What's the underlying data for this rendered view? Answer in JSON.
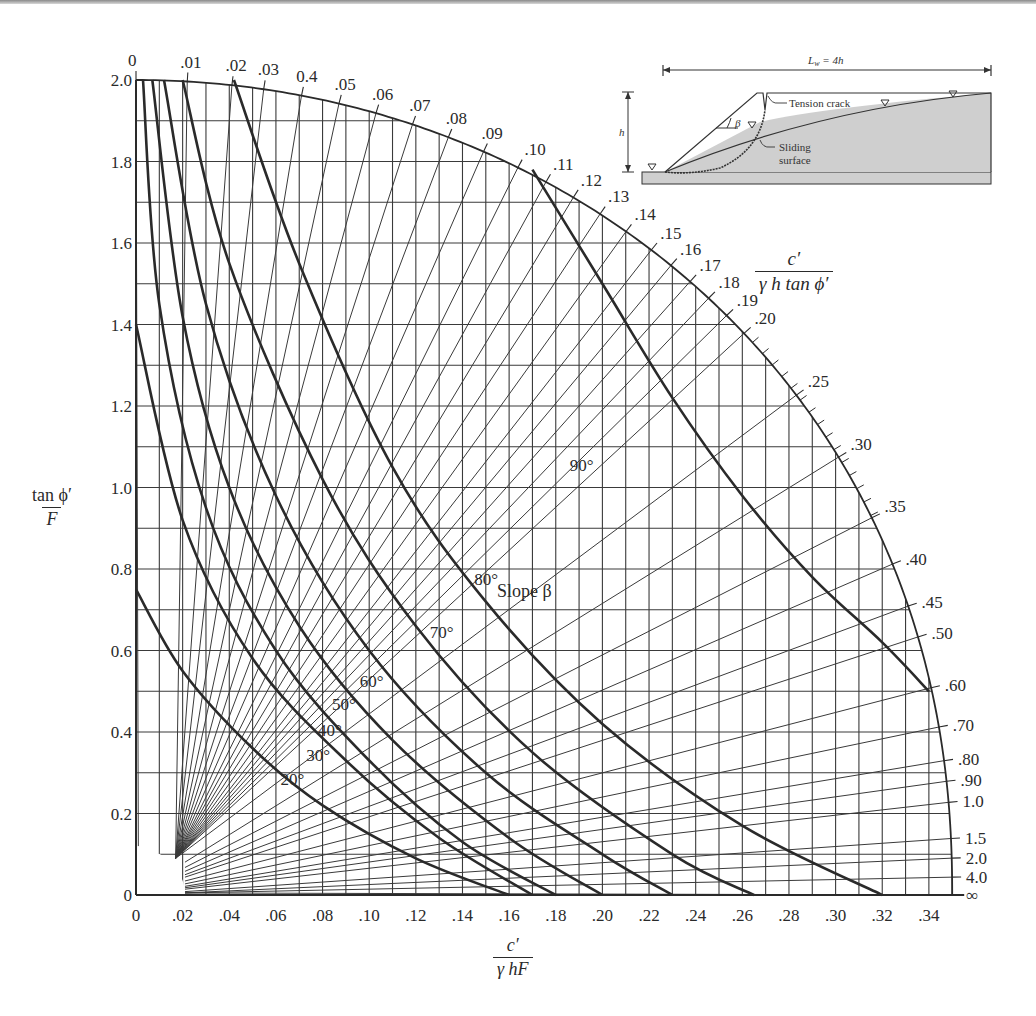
{
  "chart_data": {
    "type": "line",
    "title": "",
    "xlabel": {
      "numerator": "c′",
      "denominator": "γ hF"
    },
    "ylabel": {
      "numerator": "tan ϕ′",
      "denominator": "F"
    },
    "arc_label": {
      "numerator": "c′",
      "denominator": "γ h  tan ϕ′"
    },
    "xlim": [
      0,
      0.35
    ],
    "ylim": [
      0,
      2.0
    ],
    "grid": true,
    "x_ticks": [
      0,
      0.02,
      0.04,
      0.06,
      0.08,
      0.1,
      0.12,
      0.14,
      0.16,
      0.18,
      0.2,
      0.22,
      0.24,
      0.26,
      0.28,
      0.3,
      0.32,
      0.34
    ],
    "x_tick_labels": [
      "0",
      ".02",
      ".04",
      ".06",
      ".08",
      ".10",
      ".12",
      ".14",
      ".16",
      ".18",
      ".20",
      ".22",
      ".24",
      ".26",
      ".28",
      ".30",
      ".32",
      ".34"
    ],
    "y_ticks": [
      0,
      0.2,
      0.4,
      0.6,
      0.8,
      1.0,
      1.2,
      1.4,
      1.6,
      1.8,
      2.0
    ],
    "y_tick_labels": [
      "0",
      "0.2",
      "0.4",
      "0.6",
      "0.8",
      "1.0",
      "1.2",
      "1.4",
      "1.6",
      "1.8",
      "2.0"
    ],
    "radial_lines": {
      "description": "Lines of constant c'/(γ h tan ϕ') radiating from near origin to the outer arc",
      "labels": [
        "0",
        ".01",
        ".02",
        ".03",
        "0.4",
        ".05",
        ".06",
        ".07",
        ".08",
        ".09",
        ".10",
        ".11",
        ".12",
        ".13",
        ".14",
        ".15",
        ".16",
        ".17",
        ".18",
        ".19",
        ".20",
        ".25",
        ".30",
        ".35",
        ".40",
        ".45",
        ".50",
        ".60",
        ".70",
        ".80",
        ".90",
        "1.0",
        "1.5",
        "2.0",
        "4.0",
        "∞"
      ],
      "values": [
        0,
        0.01,
        0.02,
        0.03,
        0.04,
        0.05,
        0.06,
        0.07,
        0.08,
        0.09,
        0.1,
        0.11,
        0.12,
        0.13,
        0.14,
        0.15,
        0.16,
        0.17,
        0.18,
        0.19,
        0.2,
        0.25,
        0.3,
        0.35,
        0.4,
        0.45,
        0.5,
        0.6,
        0.7,
        0.8,
        0.9,
        1.0,
        1.5,
        2.0,
        4.0,
        "inf"
      ]
    },
    "series": [
      {
        "name": "20°",
        "points": [
          [
            0,
            0.75
          ],
          [
            0.02,
            0.55
          ],
          [
            0.05,
            0.36
          ],
          [
            0.08,
            0.22
          ],
          [
            0.12,
            0.09
          ],
          [
            0.16,
            0
          ]
        ]
      },
      {
        "name": "30°",
        "points": [
          [
            0,
            1.4
          ],
          [
            0.02,
            0.92
          ],
          [
            0.05,
            0.58
          ],
          [
            0.09,
            0.33
          ],
          [
            0.13,
            0.14
          ],
          [
            0.17,
            0
          ]
        ]
      },
      {
        "name": "40°",
        "points": [
          [
            0.003,
            2.0
          ],
          [
            0.01,
            1.45
          ],
          [
            0.03,
            0.95
          ],
          [
            0.06,
            0.6
          ],
          [
            0.1,
            0.33
          ],
          [
            0.14,
            0.13
          ],
          [
            0.18,
            0
          ]
        ]
      },
      {
        "name": "50°",
        "points": [
          [
            0.007,
            2.0
          ],
          [
            0.02,
            1.42
          ],
          [
            0.04,
            1.0
          ],
          [
            0.07,
            0.66
          ],
          [
            0.11,
            0.38
          ],
          [
            0.16,
            0.14
          ],
          [
            0.2,
            0
          ]
        ]
      },
      {
        "name": "60°",
        "points": [
          [
            0.012,
            2.0
          ],
          [
            0.03,
            1.45
          ],
          [
            0.06,
            0.98
          ],
          [
            0.1,
            0.6
          ],
          [
            0.15,
            0.3
          ],
          [
            0.2,
            0.1
          ],
          [
            0.23,
            0
          ]
        ]
      },
      {
        "name": "70°",
        "points": [
          [
            0.02,
            2.0
          ],
          [
            0.04,
            1.55
          ],
          [
            0.08,
            1.02
          ],
          [
            0.12,
            0.66
          ],
          [
            0.17,
            0.35
          ],
          [
            0.23,
            0.1
          ],
          [
            0.265,
            0
          ]
        ]
      },
      {
        "name": "80°",
        "points": [
          [
            0.042,
            2.0
          ],
          [
            0.07,
            1.55
          ],
          [
            0.11,
            1.05
          ],
          [
            0.15,
            0.72
          ],
          [
            0.2,
            0.42
          ],
          [
            0.26,
            0.17
          ],
          [
            0.32,
            0
          ]
        ]
      },
      {
        "name": "90°",
        "points": [
          [
            0.17,
            1.78
          ],
          [
            0.2,
            1.5
          ],
          [
            0.23,
            1.22
          ],
          [
            0.26,
            0.98
          ],
          [
            0.29,
            0.78
          ],
          [
            0.32,
            0.62
          ],
          [
            0.34,
            0.5
          ]
        ]
      }
    ],
    "annotations": [
      "Slope β",
      "20°",
      "30°",
      "40°",
      "50°",
      "60°",
      "70°",
      "80°",
      "90°"
    ]
  },
  "slope_label": "Slope β",
  "inset": {
    "width_label": "L",
    "width_sub": "w",
    "width_value": " = 4h",
    "height_label": "h",
    "angle_label": "β",
    "tension_crack_label": "Tension crack",
    "sliding_label_1": "Sliding",
    "sliding_label_2": "surface"
  },
  "colors": {
    "ink": "#2a2a2a",
    "grid": "#3a3a3a",
    "soil_fill": "#cfcfcf",
    "background": "#ffffff"
  }
}
